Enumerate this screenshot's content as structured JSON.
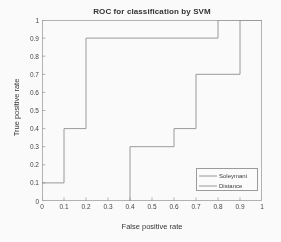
{
  "chart_data": {
    "type": "line",
    "title": "ROC for classification by SVM",
    "xlabel": "False positive rate",
    "ylabel": "True positive rate",
    "xlim": [
      0,
      1
    ],
    "ylim": [
      0,
      1
    ],
    "grid": false,
    "legend_position": "lower right",
    "xticks": [
      "0",
      "0.1",
      "0.2",
      "0.3",
      "0.4",
      "0.5",
      "0.6",
      "0.7",
      "0.8",
      "0.9",
      "1"
    ],
    "xtick_values": [
      0,
      0.1,
      0.2,
      0.3,
      0.4,
      0.5,
      0.6,
      0.7,
      0.8,
      0.9,
      1
    ],
    "yticks": [
      "0",
      "0.1",
      "0.2",
      "0.3",
      "0.4",
      "0.5",
      "0.6",
      "0.7",
      "0.8",
      "0.9",
      "1"
    ],
    "ytick_values": [
      0,
      0.1,
      0.2,
      0.3,
      0.4,
      0.5,
      0.6,
      0.7,
      0.8,
      0.9,
      1
    ],
    "series": [
      {
        "name": "Soleymani",
        "style": "solid",
        "color": "#8c8c8c",
        "x": [
          0,
          0.1,
          0.1,
          0.2,
          0.2,
          0.8,
          0.8,
          1
        ],
        "y": [
          0.1,
          0.1,
          0.4,
          0.4,
          0.9,
          0.9,
          1.0,
          1.0
        ]
      },
      {
        "name": "Distance",
        "style": "solid",
        "color": "#8c8c8c",
        "x": [
          0.4,
          0.4,
          0.6,
          0.6,
          0.7,
          0.7,
          0.9,
          0.9,
          1
        ],
        "y": [
          0,
          0.3,
          0.3,
          0.4,
          0.4,
          0.7,
          0.7,
          1.0,
          1.0
        ]
      }
    ]
  },
  "legend": {
    "items": [
      {
        "label": "Soleymani"
      },
      {
        "label": "Distance"
      }
    ]
  }
}
